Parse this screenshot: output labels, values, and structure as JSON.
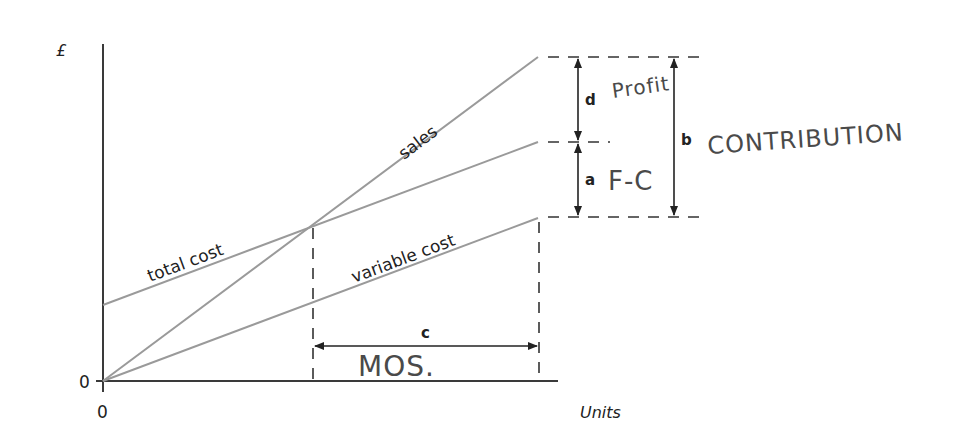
{
  "diagram": {
    "type": "break-even chart",
    "axes": {
      "y_label": "£",
      "y_origin": "0",
      "x_origin": "0",
      "x_label": "Units"
    },
    "lines": {
      "sales": "sales",
      "total_cost": "total cost",
      "variable_cost": "variable cost"
    },
    "dimensions": {
      "a": "a",
      "b": "b",
      "c": "c",
      "d": "d"
    },
    "handwritten_annotations": {
      "profit": "Profit",
      "fixed_cost": "F-C",
      "contribution": "CONTRIBUTION",
      "margin_of_safety": "MOS."
    },
    "colors": {
      "axis": "#3a3a3a",
      "lines": "#9a9a9a",
      "annotations": "#222222",
      "handwriting": "#4a4a4a"
    }
  }
}
